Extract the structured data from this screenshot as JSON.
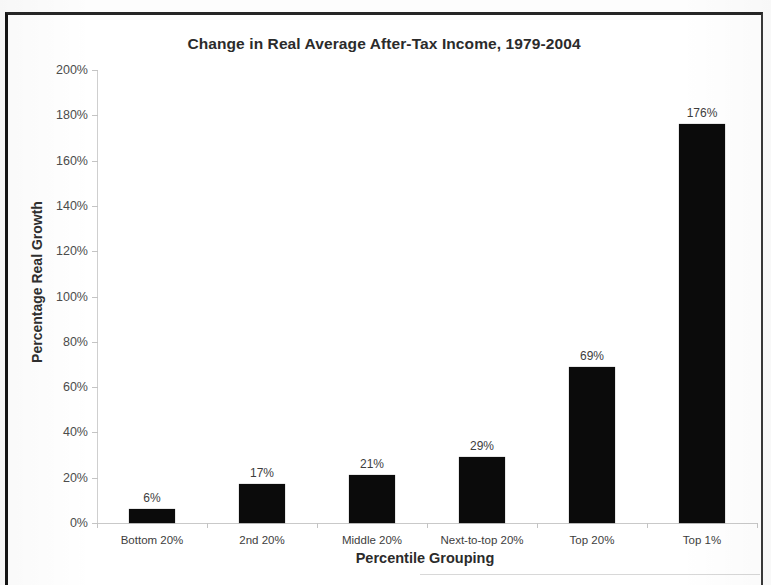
{
  "chart_data": {
    "type": "bar",
    "title": "Change in Real Average After-Tax Income, 1979-2004",
    "xlabel": "Percentile Grouping",
    "ylabel": "Percentage Real Growth",
    "categories": [
      "Bottom 20%",
      "2nd 20%",
      "Middle 20%",
      "Next-to-top 20%",
      "Top 20%",
      "Top 1%"
    ],
    "values": [
      6,
      17,
      21,
      29,
      69,
      176
    ],
    "value_labels": [
      "6%",
      "17%",
      "21%",
      "29%",
      "69%",
      "176%"
    ],
    "ylim": [
      0,
      200
    ],
    "y_tick_step": 20,
    "y_tick_labels": [
      "200%",
      "180%",
      "160%",
      "140%",
      "120%",
      "100%",
      "80%",
      "60%",
      "40%",
      "20%",
      "0%"
    ],
    "y_tick_values": [
      200,
      180,
      160,
      140,
      120,
      100,
      80,
      60,
      40,
      20,
      0
    ],
    "grid": false,
    "legend": null,
    "bar_color": "#0b0b0b",
    "axis_color": "#c9c9c9",
    "text_color": "#3d3d3d",
    "title_color": "#2b2b2b"
  }
}
